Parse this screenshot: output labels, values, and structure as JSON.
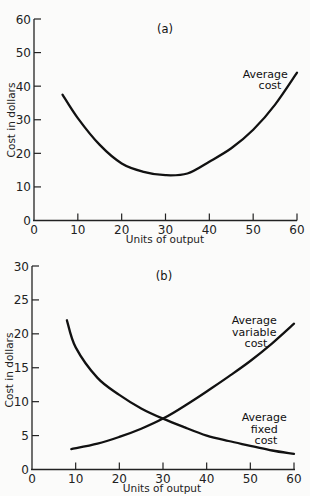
{
  "chart_data": [
    {
      "type": "line",
      "panel_label": "(a)",
      "title": "",
      "xlabel": "Units of output",
      "ylabel": "Cost in dollars",
      "xlim": [
        0,
        60
      ],
      "ylim": [
        0,
        60
      ],
      "x_ticks": [
        "0",
        "10",
        "20",
        "30",
        "40",
        "50",
        "60"
      ],
      "y_ticks": [
        "0",
        "10",
        "20",
        "30",
        "40",
        "50",
        "60"
      ],
      "grid": false,
      "series": [
        {
          "name": "Average cost",
          "label_lines": [
            "Average",
            "cost"
          ],
          "x": [
            6.5,
            10,
            15,
            20,
            25,
            30,
            35,
            40,
            45,
            50,
            55,
            60
          ],
          "y": [
            37.5,
            30.5,
            22.5,
            17,
            14.5,
            13.5,
            14,
            17.5,
            21.5,
            27,
            34.5,
            44
          ]
        }
      ]
    },
    {
      "type": "line",
      "panel_label": "(b)",
      "title": "",
      "xlabel": "Units of output",
      "ylabel": "Cost in dollars",
      "xlim": [
        0,
        60
      ],
      "ylim": [
        0,
        30
      ],
      "x_ticks": [
        "0",
        "10",
        "20",
        "30",
        "40",
        "50",
        "60"
      ],
      "y_ticks": [
        "0",
        "5",
        "10",
        "15",
        "20",
        "25",
        "30"
      ],
      "grid": false,
      "series": [
        {
          "name": "Average variable cost",
          "label_lines": [
            "Average",
            "variable",
            "cost"
          ],
          "x": [
            9,
            15,
            20,
            25,
            30,
            35,
            40,
            45,
            50,
            55,
            60
          ],
          "y": [
            3,
            3.8,
            4.8,
            6,
            7.5,
            9.4,
            11.5,
            13.7,
            16,
            18.6,
            21.5
          ]
        },
        {
          "name": "Average fixed cost",
          "label_lines": [
            "Average",
            "fixed",
            "cost"
          ],
          "x": [
            8,
            10,
            15,
            20,
            25,
            30,
            35,
            40,
            45,
            50,
            55,
            60
          ],
          "y": [
            22,
            18,
            13.5,
            11,
            9,
            7.5,
            6.2,
            5,
            4.2,
            3.5,
            2.8,
            2.3
          ]
        }
      ]
    }
  ]
}
